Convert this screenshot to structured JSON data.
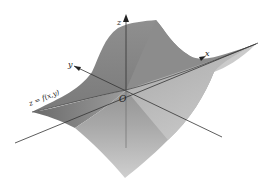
{
  "figure": {
    "type": "3d-surface-diagram",
    "surface_label": "z = f(x,y)",
    "axes": {
      "z_label": "z",
      "x_label": "x",
      "y_label": "y",
      "origin_label": "O"
    },
    "colors": {
      "background": "#ffffff",
      "surface_dark": "#6e6e6e",
      "surface_mid": "#9a9a9a",
      "surface_light": "#c8c8c8",
      "axis": "#333333"
    }
  }
}
